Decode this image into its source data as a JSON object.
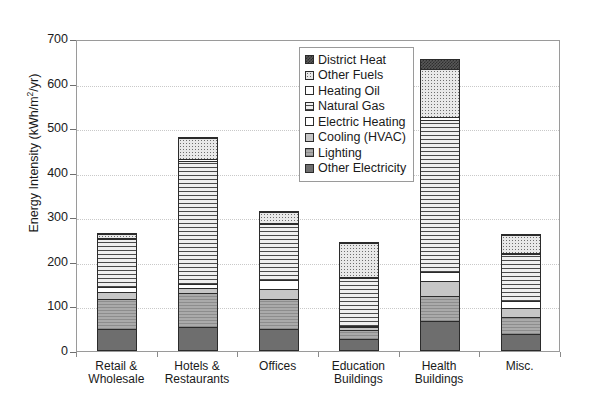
{
  "chart_data": {
    "type": "bar",
    "subtype": "stacked-bar",
    "title": "",
    "xlabel": "",
    "ylabel": "Energy Intensity (kWh/m2/yr)",
    "ylabel_parts": {
      "prefix": "Energy Intensity (kWh/m",
      "sup": "2",
      "suffix": "/yr)"
    },
    "ylim": [
      0,
      700
    ],
    "ytick_values": [
      0,
      100,
      200,
      300,
      400,
      500,
      600,
      700
    ],
    "ytick_labels": [
      "0",
      "100",
      "200",
      "300",
      "400",
      "500",
      "600",
      "700"
    ],
    "grid": true,
    "legend_position": "top-center-inside",
    "categories": [
      "Retail & Wholesale",
      "Hotels & Restaurants",
      "Offices",
      "Education Buildings",
      "Health Buildings",
      "Misc."
    ],
    "category_lines": [
      [
        "Retail &",
        "Wholesale"
      ],
      [
        "Hotels &",
        "Restaurants"
      ],
      [
        "Offices",
        ""
      ],
      [
        "Education",
        "Buildings"
      ],
      [
        "Health",
        "Buildings"
      ],
      [
        "Misc.",
        ""
      ]
    ],
    "series": [
      {
        "name": "Other Electricity",
        "pattern": "other-electricity",
        "values": [
          50,
          55,
          50,
          28,
          68,
          38
        ]
      },
      {
        "name": "Lighting",
        "pattern": "lighting",
        "values": [
          70,
          77,
          68,
          22,
          58,
          40
        ]
      },
      {
        "name": "Cooling (HVAC)",
        "pattern": "cooling",
        "values": [
          18,
          14,
          26,
          8,
          35,
          22
        ]
      },
      {
        "name": "Electric Heating",
        "pattern": "electric-heating",
        "values": [
          12,
          12,
          23,
          6,
          22,
          18
        ]
      },
      {
        "name": "Natural Gas",
        "pattern": "natural-gas",
        "values": [
          110,
          278,
          128,
          108,
          345,
          108
        ]
      },
      {
        "name": "Heating Oil",
        "pattern": "heating-oil",
        "values": [
          3,
          5,
          4,
          3,
          8,
          4
        ]
      },
      {
        "name": "Other Fuels",
        "pattern": "other-fuels",
        "values": [
          12,
          50,
          25,
          80,
          110,
          44
        ]
      },
      {
        "name": "District Heat",
        "pattern": "district-heat",
        "values": [
          3,
          6,
          3,
          5,
          24,
          3
        ]
      }
    ],
    "totals": [
      278,
      497,
      327,
      260,
      670,
      277
    ]
  },
  "legend": {
    "entries": [
      {
        "label": "District Heat",
        "pattern": "district-heat"
      },
      {
        "label": "Other Fuels",
        "pattern": "other-fuels"
      },
      {
        "label": "Heating Oil",
        "pattern": "heating-oil"
      },
      {
        "label": "Natural Gas",
        "pattern": "natural-gas"
      },
      {
        "label": "Electric Heating",
        "pattern": "electric-heating"
      },
      {
        "label": "Cooling (HVAC)",
        "pattern": "cooling"
      },
      {
        "label": "Lighting",
        "pattern": "lighting"
      },
      {
        "label": "Other Electricity",
        "pattern": "other-electricity"
      }
    ]
  }
}
